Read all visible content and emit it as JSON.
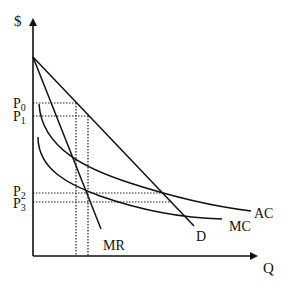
{
  "diagram": {
    "axes": {
      "y_label": "$",
      "x_label": "Q"
    },
    "price_labels": [
      {
        "base": "P",
        "sub": "0",
        "y": 103
      },
      {
        "base": "P",
        "sub": "1",
        "y": 116
      },
      {
        "base": "P",
        "sub": "2",
        "y": 193
      },
      {
        "base": "P",
        "sub": "3",
        "y": 202
      }
    ],
    "curves": {
      "demand": {
        "label": "D"
      },
      "marginal_revenue": {
        "label": "MR"
      },
      "average_cost": {
        "label": "AC"
      },
      "marginal_cost": {
        "label": "MC"
      }
    },
    "colors": {
      "line": "#111111",
      "background": "#ffffff"
    }
  }
}
